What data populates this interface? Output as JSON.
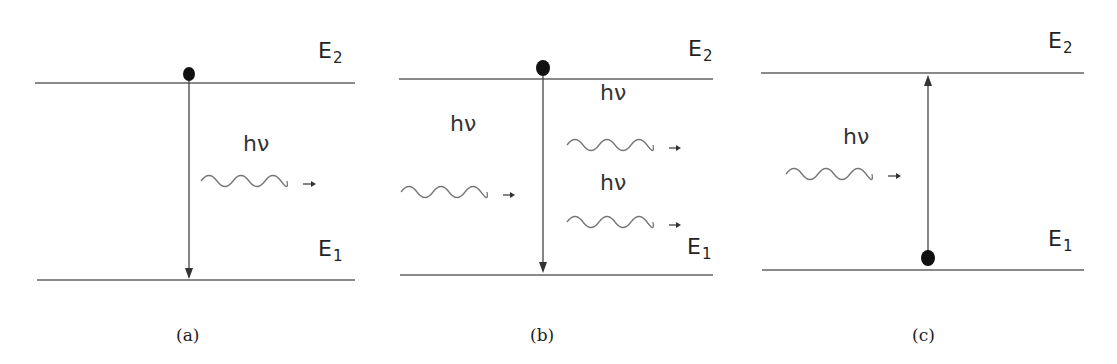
{
  "figure": {
    "panels": [
      {
        "id": "a",
        "caption": "(a)",
        "process": "spontaneous emission",
        "upper_level_label": "E",
        "upper_level_sub": "2",
        "lower_level_label": "E",
        "lower_level_sub": "1",
        "photon_labels": [
          "hν"
        ],
        "electron_position": "upper",
        "transition_arrow": "down"
      },
      {
        "id": "b",
        "caption": "(b)",
        "process": "stimulated emission",
        "upper_level_label": "E",
        "upper_level_sub": "2",
        "lower_level_label": "E",
        "lower_level_sub": "1",
        "photon_labels": [
          "hν",
          "hν",
          "hν"
        ],
        "electron_position": "upper",
        "transition_arrow": "down"
      },
      {
        "id": "c",
        "caption": "(c)",
        "process": "absorption",
        "upper_level_label": "E",
        "upper_level_sub": "2",
        "lower_level_label": "E",
        "lower_level_sub": "1",
        "photon_labels": [
          "hν"
        ],
        "electron_position": "lower",
        "transition_arrow": "up"
      }
    ],
    "colors": {
      "level_line": "#8a8a8a",
      "arrow": "#333333",
      "wave": "#777777",
      "electron": "#111111",
      "text": "#222222"
    }
  }
}
